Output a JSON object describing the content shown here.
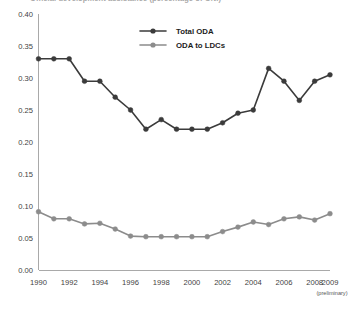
{
  "chart_data": {
    "type": "line",
    "title": "Official development assistance (percentage of GNI)",
    "xlabel": "",
    "ylabel": "",
    "ylim": [
      0.0,
      0.4
    ],
    "ytick_labels": [
      "0.00",
      "0.05",
      "0.10",
      "0.15",
      "0.20",
      "0.25",
      "0.30",
      "0.35",
      "0.40"
    ],
    "ytick_values": [
      0.0,
      0.05,
      0.1,
      0.15,
      0.2,
      0.25,
      0.3,
      0.35,
      0.4
    ],
    "xlim": [
      1990,
      2009
    ],
    "xtick_labels": [
      "1990",
      "1992",
      "1994",
      "1996",
      "1998",
      "2000",
      "2002",
      "2004",
      "2006",
      "2008",
      "2009"
    ],
    "xtick_values": [
      1990,
      1992,
      1994,
      1996,
      1998,
      2000,
      2002,
      2004,
      2006,
      2008,
      2009
    ],
    "x_note": "(preliminary)",
    "x_note_at": 2009,
    "grid": false,
    "legend_position": "top-center",
    "x": [
      1990,
      1991,
      1992,
      1993,
      1994,
      1995,
      1996,
      1997,
      1998,
      1999,
      2000,
      2001,
      2002,
      2003,
      2004,
      2005,
      2006,
      2007,
      2008,
      2009
    ],
    "series": [
      {
        "name": "Total ODA",
        "color": "#3b3b3b",
        "values": [
          0.33,
          0.33,
          0.33,
          0.295,
          0.295,
          0.27,
          0.25,
          0.22,
          0.235,
          0.22,
          0.22,
          0.22,
          0.23,
          0.245,
          0.25,
          0.315,
          0.295,
          0.265,
          0.295,
          0.305
        ]
      },
      {
        "name": "ODA to LDCs",
        "color": "#8c8c8c",
        "values": [
          0.091,
          0.08,
          0.08,
          0.072,
          0.073,
          0.064,
          0.053,
          0.052,
          0.052,
          0.052,
          0.052,
          0.052,
          0.06,
          0.067,
          0.075,
          0.071,
          0.08,
          0.083,
          0.078,
          0.088
        ]
      }
    ]
  },
  "legend": {
    "entries": [
      {
        "label": "Total ODA",
        "color": "#3b3b3b"
      },
      {
        "label": "ODA to LDCs",
        "color": "#8c8c8c"
      }
    ]
  },
  "colors": {
    "total_oda": "#3b3b3b",
    "oda_to_ldcs": "#8c8c8c",
    "axis": "#a9a9a9",
    "text": "#3f3f3f",
    "background": "#ffffff"
  }
}
